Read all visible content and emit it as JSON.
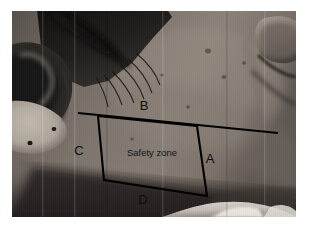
{
  "figure": {
    "kind": "clinical-photograph",
    "background_color": "#ffffff",
    "photo": {
      "border_color": "#ffffff",
      "skin_tone_mid": "#7b736c",
      "skin_tone_light": "#b9b1a8",
      "shadow_tone": "#2e2a27",
      "hair_tone": "#1b1816"
    }
  },
  "annotation": {
    "outline_color": "#000000",
    "caption": "Safety zone",
    "labels": [
      {
        "id": "A",
        "text": "A",
        "x": 210,
        "y": 163
      },
      {
        "id": "B",
        "text": "B",
        "x": 144,
        "y": 110
      },
      {
        "id": "C",
        "text": "C",
        "x": 79,
        "y": 155
      },
      {
        "id": "D",
        "text": "D",
        "x": 143,
        "y": 204
      }
    ],
    "caption_position": {
      "x": 127,
      "y": 156
    },
    "zone_polygon": "98,116 197,126 207,196 104,180",
    "upper_border_line": "78,113 278,133",
    "right_border_line": "197,126 278,133"
  }
}
